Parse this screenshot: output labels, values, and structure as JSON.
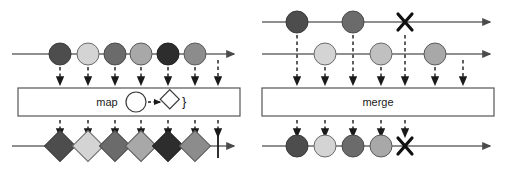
{
  "figure": {
    "type": "marble-diagram-pair",
    "background": "#ffffff",
    "stroke": "#555555",
    "dark_stroke": "#1a1a1a"
  },
  "palette": {
    "very_dark": "#2d2d2d",
    "dark": "#4d4d4d",
    "mid_dark": "#6b6b6b",
    "mid": "#8c8c8c",
    "mid_light": "#a8a8a8",
    "light": "#c9c9c9",
    "very_light": "#dcdcdc",
    "outline": "#555555",
    "axis": "#6a6a6a",
    "ink": "#1a1a1a"
  },
  "diagrams": [
    {
      "id": "map",
      "operator_label": "map",
      "projection_hint": {
        "from_shape": "circle",
        "arrow": "dashed-arrow",
        "to_shape": "diamond",
        "closing_brace": "}"
      },
      "input_streams": [
        {
          "name": "source",
          "y": 54,
          "x_start": 12,
          "x_end": 238,
          "terminator": "arrow",
          "marbles": [
            {
              "shape": "circle",
              "x": 60,
              "fill": "#4d4d4d"
            },
            {
              "shape": "circle",
              "x": 88,
              "fill": "#d4d4d4"
            },
            {
              "shape": "circle",
              "x": 115,
              "fill": "#6b6b6b"
            },
            {
              "shape": "circle",
              "x": 141,
              "fill": "#a8a8a8"
            },
            {
              "shape": "circle",
              "x": 168,
              "fill": "#2d2d2d"
            },
            {
              "shape": "circle",
              "x": 195,
              "fill": "#8c8c8c"
            }
          ]
        }
      ],
      "operator_box": {
        "x": 18,
        "y": 88,
        "width": 222,
        "height": 28
      },
      "input_arrow_xs": [
        60,
        88,
        115,
        141,
        168,
        195,
        218
      ],
      "output_arrow_xs": [
        60,
        88,
        115,
        141,
        168,
        195,
        218
      ],
      "output_streams": [
        {
          "name": "projected",
          "y": 146,
          "x_start": 12,
          "x_end": 238,
          "terminator": "arrow",
          "complete_bar_x": 218,
          "marbles": [
            {
              "shape": "diamond",
              "x": 60,
              "fill": "#4d4d4d"
            },
            {
              "shape": "diamond",
              "x": 88,
              "fill": "#d4d4d4"
            },
            {
              "shape": "diamond",
              "x": 115,
              "fill": "#6b6b6b"
            },
            {
              "shape": "diamond",
              "x": 141,
              "fill": "#a8a8a8"
            },
            {
              "shape": "diamond",
              "x": 168,
              "fill": "#2d2d2d"
            },
            {
              "shape": "diamond",
              "x": 195,
              "fill": "#8c8c8c"
            }
          ]
        }
      ]
    },
    {
      "id": "merge",
      "operator_label": "merge",
      "input_streams": [
        {
          "name": "source-a",
          "y": 22,
          "x_start": 10,
          "x_end": 242,
          "terminator": "arrow",
          "error_x": 153,
          "marbles": [
            {
              "shape": "circle",
              "x": 45,
              "fill": "#4d4d4d"
            },
            {
              "shape": "circle",
              "x": 101,
              "fill": "#6b6b6b"
            }
          ]
        },
        {
          "name": "source-b",
          "y": 54,
          "x_start": 10,
          "x_end": 242,
          "terminator": "arrow",
          "marbles": [
            {
              "shape": "circle",
              "x": 73,
              "fill": "#d4d4d4"
            },
            {
              "shape": "circle",
              "x": 129,
              "fill": "#c0c0c0"
            },
            {
              "shape": "circle",
              "x": 183,
              "fill": "#a8a8a8"
            }
          ]
        }
      ],
      "operator_box": {
        "x": 10,
        "y": 88,
        "width": 232,
        "height": 28
      },
      "input_arrow_xs": [
        45,
        73,
        101,
        129,
        153,
        183,
        211
      ],
      "output_arrow_xs": [
        45,
        73,
        101,
        129,
        153
      ],
      "output_streams": [
        {
          "name": "merged",
          "y": 146,
          "x_start": 10,
          "x_end": 242,
          "terminator": "arrow",
          "error_x": 153,
          "marbles": [
            {
              "shape": "circle",
              "x": 45,
              "fill": "#4d4d4d"
            },
            {
              "shape": "circle",
              "x": 73,
              "fill": "#d4d4d4"
            },
            {
              "shape": "circle",
              "x": 101,
              "fill": "#6b6b6b"
            },
            {
              "shape": "circle",
              "x": 129,
              "fill": "#a8a8a8"
            }
          ]
        }
      ]
    }
  ]
}
